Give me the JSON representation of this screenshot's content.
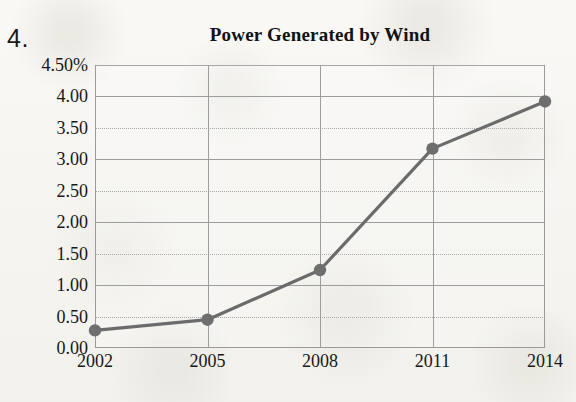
{
  "worksheet": {
    "question_number": "4."
  },
  "chart_data": {
    "type": "line",
    "title": "Power Generated by Wind",
    "xlabel": "",
    "ylabel": "",
    "categories": [
      "2002",
      "2005",
      "2008",
      "2011",
      "2014"
    ],
    "x": [
      2002,
      2005,
      2008,
      2011,
      2014
    ],
    "values": [
      0.28,
      0.45,
      1.24,
      3.17,
      3.92
    ],
    "series": [
      {
        "name": "Power Generated by Wind",
        "values": [
          0.28,
          0.45,
          1.24,
          3.17,
          3.92
        ]
      }
    ],
    "ylim": [
      0.0,
      4.5
    ],
    "ytick_values": [
      0.0,
      0.5,
      1.0,
      1.5,
      2.0,
      2.5,
      3.0,
      3.5,
      4.0,
      4.5
    ],
    "ytick_labels": [
      "0.00",
      "0.50",
      "1.00",
      "1.50",
      "2.00",
      "2.50",
      "3.00",
      "3.50",
      "4.00",
      "4.50%"
    ],
    "xtick_labels": [
      "2002",
      "2005",
      "2008",
      "2011",
      "2014"
    ],
    "grid": "horizontal-and-vertical",
    "legend": "none",
    "unit": "%",
    "colors": {
      "line": "#6b6b6b",
      "marker": "#6e6e6e",
      "grid": "#9d9d9d",
      "axis": "#9a9a9a",
      "text": "#171717",
      "paper": "#f7f6f3"
    }
  }
}
